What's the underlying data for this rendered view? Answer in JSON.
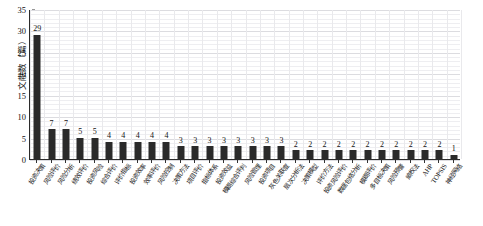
{
  "chart_data": {
    "type": "bar",
    "title": "",
    "xlabel": "",
    "ylabel": "文献数（篇）",
    "ylim": [
      0,
      35
    ],
    "ytick_labels": [
      "0",
      "5",
      "10",
      "15",
      "20",
      "25",
      "30",
      "35"
    ],
    "yticks": [
      0,
      5,
      10,
      15,
      20,
      25,
      30,
      35
    ],
    "grid": true,
    "legend": "none",
    "bar_color": "#2a2a2a",
    "categories": [
      "投资决策",
      "风险评价",
      "风险分析",
      "绩效评价",
      "投资风险",
      "综合评价",
      "评价指标",
      "投资效率",
      "效率评价",
      "风险控制",
      "决策方法",
      "项目评价",
      "指标体系",
      "投资效益",
      "模糊综合评判",
      "风险管理",
      "投资项目",
      "灰色关联度",
      "层次分析法",
      "决策模型",
      "评价方法",
      "投资风险评价",
      "数据包络分析",
      "模糊评价",
      "多目标决策",
      "风险预警",
      "熵权法",
      "AHP",
      "TOPSIS",
      "神经网络"
    ],
    "values": [
      29,
      7,
      7,
      5,
      5,
      4,
      4,
      4,
      4,
      4,
      3,
      3,
      3,
      3,
      3,
      3,
      3,
      3,
      2,
      2,
      2,
      2,
      2,
      2,
      2,
      2,
      2,
      2,
      2,
      1
    ],
    "value_labels": [
      "29",
      "7",
      "7",
      "5",
      "5",
      "4",
      "4",
      "4",
      "4",
      "4",
      "3",
      "3",
      "3",
      "3",
      "3",
      "3",
      "3",
      "3",
      "2",
      "2",
      "2",
      "2",
      "2",
      "2",
      "2",
      "2",
      "2",
      "2",
      "2",
      "1"
    ]
  }
}
